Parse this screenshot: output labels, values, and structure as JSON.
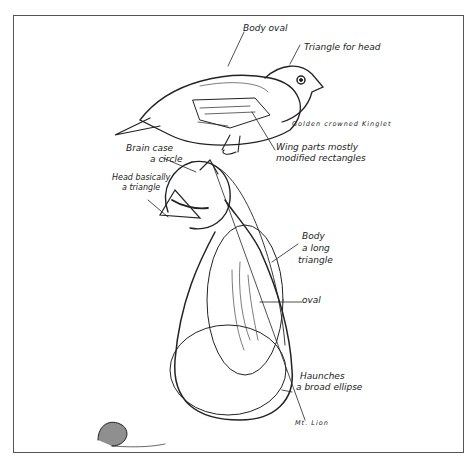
{
  "bird": {
    "name": "Golden crowned Kinglet",
    "labels": {
      "body": "Body oval",
      "head": "Triangle for head",
      "wing_line1": "Wing parts mostly",
      "wing_line2": "modified rectangles"
    }
  },
  "lion": {
    "name": "Mt. Lion",
    "labels": {
      "brain_line1": "Brain case",
      "brain_line2": "a circle",
      "head_line1": "Head basically",
      "head_line2": "a triangle",
      "body_line1": "Body",
      "body_line2": "a long",
      "body_line3": "triangle",
      "oval": "oval",
      "haunch_line1": "Haunches",
      "haunch_line2": "a broad ellipse"
    }
  },
  "colors": {
    "ink": "#222222",
    "frame": "#555555",
    "paper": "#ffffff"
  }
}
